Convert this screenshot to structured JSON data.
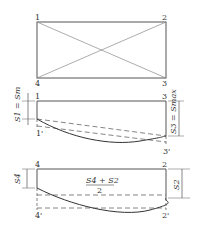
{
  "figure": {
    "top": {
      "corners": {
        "tl": "1",
        "tr": "2",
        "bl": "4",
        "br": "3"
      }
    },
    "middle": {
      "corners": {
        "tl": "1",
        "tr": "3",
        "bl": "1'",
        "br": "3'"
      },
      "left_dim": "S1 = Sm",
      "right_dim": "S3 = Smax"
    },
    "bottom": {
      "corners": {
        "tl": "4",
        "tr": "2",
        "bl": "4'",
        "br": "2'"
      },
      "left_dim": "S4",
      "right_dim": "S2",
      "fraction_num": "S4 + S2",
      "fraction_den": "2"
    }
  },
  "colors": {
    "line": "#555555",
    "dash": "#666666"
  }
}
